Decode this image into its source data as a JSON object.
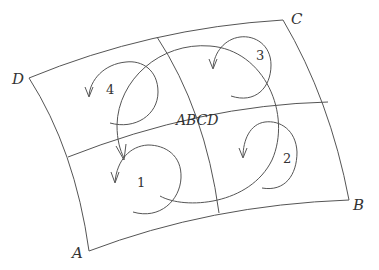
{
  "diagram": {
    "corners": {
      "A": "A",
      "B": "B",
      "C": "C",
      "D": "D"
    },
    "cells": [
      {
        "number": "1"
      },
      {
        "number": "2"
      },
      {
        "number": "3"
      },
      {
        "number": "4"
      }
    ],
    "center_label": "ABCD",
    "stroke_color": "#555555",
    "text_color": "#333333"
  }
}
